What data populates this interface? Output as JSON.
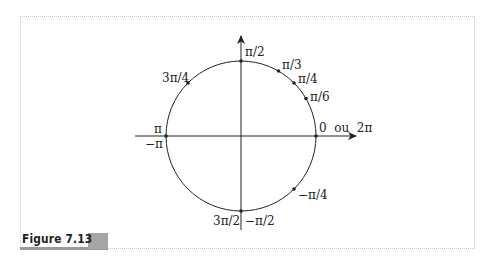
{
  "figure": {
    "caption": "Figure 7.13"
  },
  "colors": {
    "ink": "#222222",
    "frame": "#c8c8c8",
    "caption_bar": "#9a9a9a",
    "caption_box": "#a5a5a5"
  },
  "circle": {
    "center": [
      241,
      136
    ],
    "radius": 75
  },
  "labels": {
    "pi_over_2": "π/2",
    "pi_over_3": "π/3",
    "pi_over_4": "π/4",
    "pi_over_6": "π/6",
    "zero_or_2pi": "0  ou  2π",
    "three_pi_over_4": "3π/4",
    "pi": "π",
    "minus_pi": "−π",
    "minus_pi_over_4": "−π/4",
    "three_pi_over_2": "3π/2",
    "minus_pi_over_2": "−π/2"
  },
  "points": [
    {
      "angle_deg": 90,
      "label": "π/2"
    },
    {
      "angle_deg": 60,
      "label": "π/3"
    },
    {
      "angle_deg": 45,
      "label": "π/4"
    },
    {
      "angle_deg": 30,
      "label": "π/6"
    },
    {
      "angle_deg": 0,
      "label": "0 ou 2π"
    },
    {
      "angle_deg": 135,
      "label": "3π/4"
    },
    {
      "angle_deg": 180,
      "label": "π / −π"
    },
    {
      "angle_deg": -45,
      "label": "−π/4"
    },
    {
      "angle_deg": 270,
      "label": "3π/2 / −π/2"
    }
  ]
}
